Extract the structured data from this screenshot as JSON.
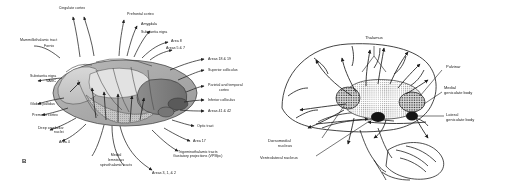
{
  "figure": {
    "background_color": "#ffffff",
    "ink_color": "#1b1b1b",
    "panel_letter_b": "B"
  },
  "panel_b": {
    "title": "Thalamic nuclei: afferent and efferent connections (dorsal view)",
    "labels_top": [
      {
        "text": "Cingulate cortex",
        "x": 72,
        "y": 8,
        "align": "c"
      },
      {
        "text": "Prefrontal cortex",
        "x": 127,
        "y": 14,
        "align": "l"
      },
      {
        "text": "Amygdala",
        "x": 141,
        "y": 24,
        "align": "l"
      },
      {
        "text": "Substantia nigra",
        "x": 141,
        "y": 32,
        "align": "l"
      },
      {
        "text": "Area 8",
        "x": 171,
        "y": 41,
        "align": "l"
      },
      {
        "text": "Areas 5 & 7",
        "x": 166,
        "y": 48,
        "align": "l"
      }
    ],
    "labels_left": [
      {
        "text": "Mammillothalamic tract",
        "x": 26,
        "y": 40,
        "align": "l"
      },
      {
        "text": "Fornix",
        "x": 44,
        "y": 46,
        "align": "l"
      },
      {
        "text": "Substantia nigra",
        "x": 34,
        "y": 76,
        "align": "l"
      },
      {
        "text": "VAMC",
        "x": 46,
        "y": 81,
        "align": "l"
      },
      {
        "text": "Globus pallidus",
        "x": 36,
        "y": 104,
        "align": "l"
      },
      {
        "text": "Premotor cortex",
        "x": 38,
        "y": 115,
        "align": "l"
      },
      {
        "text": "Deep cerebellar",
        "x": 44,
        "y": 128,
        "align": "l"
      },
      {
        "text": "nuclei",
        "x": 58,
        "y": 132,
        "align": "l"
      },
      {
        "text": "Area 4",
        "x": 63,
        "y": 142,
        "align": "l"
      }
    ],
    "labels_right": [
      {
        "text": "Areas 18 & 19",
        "x": 206,
        "y": 59,
        "align": "l"
      },
      {
        "text": "Superior colliculus",
        "x": 206,
        "y": 70,
        "align": "l"
      },
      {
        "text": "Parietal and temporal",
        "x": 206,
        "y": 85,
        "align": "l"
      },
      {
        "text": "cortex",
        "x": 219,
        "y": 90,
        "align": "l"
      },
      {
        "text": "Inferior colliculus",
        "x": 206,
        "y": 100,
        "align": "l"
      },
      {
        "text": "Areas 41 & 42",
        "x": 206,
        "y": 111,
        "align": "l"
      },
      {
        "text": "Optic tract",
        "x": 196,
        "y": 126,
        "align": "l"
      },
      {
        "text": "Area 17",
        "x": 192,
        "y": 141,
        "align": "l"
      },
      {
        "text": "Trigeminothalamic tracts",
        "x": 177,
        "y": 152,
        "align": "l"
      },
      {
        "text": "Gustatory projections (VPMpc)",
        "x": 172,
        "y": 157,
        "align": "l"
      }
    ],
    "labels_bottom": [
      {
        "text": "Medial",
        "x": 115,
        "y": 155,
        "align": "c"
      },
      {
        "text": "lemniscus",
        "x": 115,
        "y": 160,
        "align": "c"
      },
      {
        "text": "spinothalamic tracts",
        "x": 115,
        "y": 165,
        "align": "c"
      },
      {
        "text": "Areas 3, 1, & 2",
        "x": 156,
        "y": 172,
        "align": "l"
      }
    ]
  },
  "panel_c": {
    "title": "Thalamus and its projections on the medial surface of the hemisphere",
    "labels": [
      {
        "text": "Thalamus",
        "x": 118,
        "y": 38,
        "align": "c"
      },
      {
        "text": "Pulvinar",
        "x": 192,
        "y": 67,
        "align": "l"
      },
      {
        "text": "Medial",
        "x": 187,
        "y": 88,
        "align": "l"
      },
      {
        "text": "geniculate body",
        "x": 187,
        "y": 93,
        "align": "l"
      },
      {
        "text": "Lateral",
        "x": 190,
        "y": 115,
        "align": "l"
      },
      {
        "text": "geniculate body",
        "x": 190,
        "y": 120,
        "align": "l"
      },
      {
        "text": "Dorsomedial",
        "x": 13,
        "y": 141,
        "align": "l"
      },
      {
        "text": "nucleus",
        "x": 22,
        "y": 146,
        "align": "l"
      },
      {
        "text": "Ventrolateral nucleus",
        "x": 4,
        "y": 158,
        "align": "l"
      }
    ]
  }
}
